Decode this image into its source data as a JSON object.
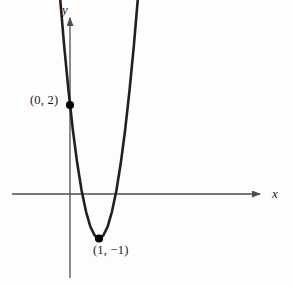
{
  "figure": {
    "name": "parabola-graph",
    "background_color": "#fdfdfd",
    "curve_color": "#231f20",
    "axis_color": "#4d4d4d",
    "point_color": "#000000",
    "axes": {
      "x_label": "x",
      "y_label": "y",
      "origin_px": [
        70,
        194
      ],
      "x_axis_span_px": [
        12,
        262
      ],
      "y_axis_span_px": [
        16,
        278
      ],
      "px_per_unit_x": 29,
      "px_per_unit_y": 44.5
    },
    "labels": [
      {
        "name": "y-intercept-label",
        "text": "(0, 2)"
      },
      {
        "name": "vertex-label",
        "text": "(1, −1)"
      }
    ]
  },
  "chart_data": {
    "type": "line",
    "title": "",
    "xlabel": "x",
    "ylabel": "y",
    "grid": false,
    "legend": null,
    "curve": {
      "name": "parabola",
      "equation": "y = 3x^2 - 6x + 2",
      "vertex": [
        1,
        -1
      ],
      "y_intercept": [
        0,
        2
      ],
      "x_intercepts": [
        0.4226,
        1.5774
      ],
      "opens": "up"
    },
    "annotations": [
      {
        "text": "(0, 2)",
        "point": [
          0,
          2
        ],
        "position": "left"
      },
      {
        "text": "(1, −1)",
        "point": [
          1,
          -1
        ],
        "position": "below"
      }
    ],
    "marked_points": [
      {
        "label": "(0, 2)",
        "x": 0,
        "y": 2
      },
      {
        "label": "(1, −1)",
        "x": 1,
        "y": -1
      }
    ],
    "xlim": [
      -2.0,
      6.62
    ],
    "ylim": [
      -1.89,
      4.0
    ],
    "x": [
      -0.65,
      -0.5,
      -0.35,
      -0.2,
      -0.05,
      0.1,
      0.25,
      0.4,
      0.55,
      0.7,
      0.85,
      1.0,
      1.15,
      1.3,
      1.45,
      1.6,
      1.75,
      1.9,
      2.05,
      2.2,
      2.35,
      2.5,
      2.65
    ],
    "values": [
      7.17,
      5.75,
      4.47,
      3.32,
      2.31,
      1.43,
      0.69,
      0.08,
      -0.39,
      -0.73,
      -0.93,
      -1.0,
      -0.93,
      -0.73,
      -0.39,
      0.08,
      0.69,
      1.43,
      2.31,
      3.32,
      4.47,
      5.75,
      7.17
    ]
  }
}
